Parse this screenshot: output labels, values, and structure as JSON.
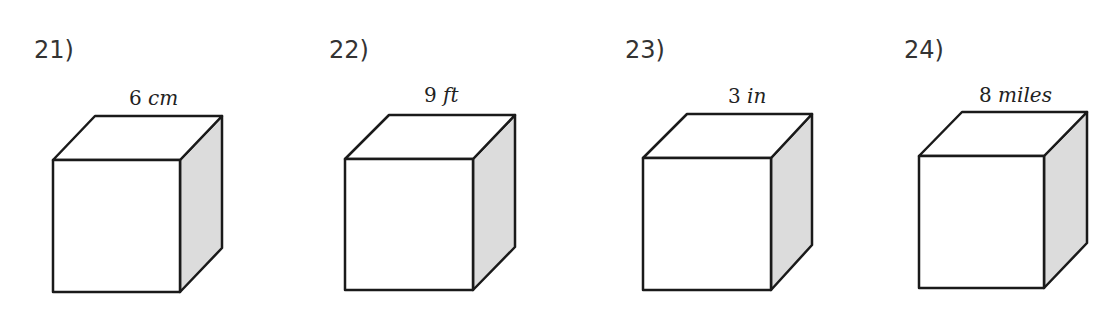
{
  "problems": [
    {
      "number": "21)",
      "value": "6",
      "unit": "cm"
    },
    {
      "number": "22)",
      "value": "9",
      "unit": "ft"
    },
    {
      "number": "23)",
      "value": "3",
      "unit": "in"
    },
    {
      "number": "24)",
      "value": "8",
      "unit": "miles"
    }
  ],
  "colors": {
    "edge": "#1a1a1a",
    "side_shade": "#dcdcdc",
    "face": "#ffffff"
  }
}
